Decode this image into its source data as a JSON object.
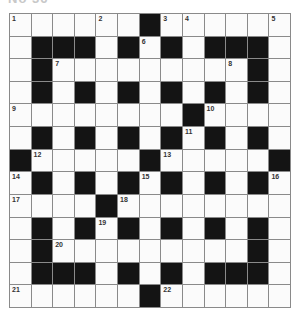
{
  "puzzle": {
    "title": "No 36",
    "rows": 13,
    "cols": 13,
    "colors": {
      "black_cell": "#141414",
      "white_cell": "#fbfbfb",
      "grid_line": "#8a8a8a",
      "number": "#333333"
    },
    "layout": [
      "......#......",
      ".###.#.#.###.",
      ".#.........#.",
      ".#.#.#.#.#.#.",
      "........#....",
      ".#.#.#.#.#.#.",
      "#.....#.....#",
      ".#.#.#.#.#.#.",
      "....#........",
      ".#.#.#.#.#.#.",
      ".#.........#.",
      ".###.#.#.###.",
      "......#......"
    ],
    "numbers": [
      {
        "row": 0,
        "col": 0,
        "n": "1"
      },
      {
        "row": 0,
        "col": 4,
        "n": "2"
      },
      {
        "row": 0,
        "col": 7,
        "n": "3"
      },
      {
        "row": 0,
        "col": 8,
        "n": "4"
      },
      {
        "row": 0,
        "col": 12,
        "n": "5"
      },
      {
        "row": 1,
        "col": 6,
        "n": "6"
      },
      {
        "row": 2,
        "col": 2,
        "n": "7"
      },
      {
        "row": 2,
        "col": 10,
        "n": "8"
      },
      {
        "row": 4,
        "col": 0,
        "n": "9"
      },
      {
        "row": 4,
        "col": 9,
        "n": "10"
      },
      {
        "row": 5,
        "col": 8,
        "n": "11"
      },
      {
        "row": 6,
        "col": 1,
        "n": "12"
      },
      {
        "row": 6,
        "col": 7,
        "n": "13"
      },
      {
        "row": 7,
        "col": 0,
        "n": "14"
      },
      {
        "row": 7,
        "col": 6,
        "n": "15"
      },
      {
        "row": 7,
        "col": 12,
        "n": "16"
      },
      {
        "row": 8,
        "col": 0,
        "n": "17"
      },
      {
        "row": 8,
        "col": 5,
        "n": "18"
      },
      {
        "row": 9,
        "col": 4,
        "n": "19"
      },
      {
        "row": 10,
        "col": 2,
        "n": "20"
      },
      {
        "row": 12,
        "col": 0,
        "n": "21"
      },
      {
        "row": 12,
        "col": 7,
        "n": "22"
      }
    ]
  }
}
